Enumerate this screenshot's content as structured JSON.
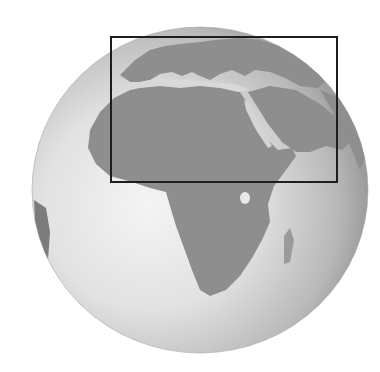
{
  "map": {
    "type": "orthographic-globe",
    "style": "grayscale-relief",
    "centered_on": "Africa",
    "visible_regions": [
      "Europe",
      "Africa",
      "Middle East",
      "Arabian Peninsula",
      "South America (edge)"
    ],
    "highlight": {
      "shape": "rectangle",
      "covers": [
        "Europe",
        "North Africa",
        "Mediterranean Sea",
        "Middle East"
      ],
      "stroke_color": "#1e1e1e"
    },
    "colors": {
      "ocean_light": "#f2f2f2",
      "ocean_dark": "#8f8f8f",
      "land": "#8a8a8a",
      "background": "#ffffff"
    }
  }
}
